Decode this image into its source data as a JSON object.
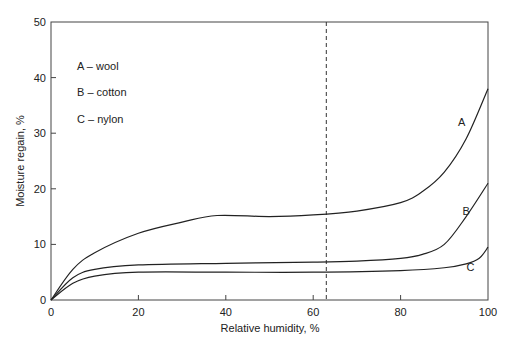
{
  "chart_data": {
    "type": "line",
    "title": "",
    "xlabel": "Relative humidity, %",
    "ylabel": "Moisture regain, %",
    "xlim": [
      0,
      100
    ],
    "ylim": [
      0,
      50
    ],
    "x_ticks": [
      "0",
      "20",
      "40",
      "60",
      "80",
      "100"
    ],
    "y_ticks": [
      "0",
      "10",
      "20",
      "30",
      "40",
      "50"
    ],
    "grid": false,
    "legend_position": "upper-left (inside)",
    "legend": [
      "A – wool",
      "B – cotton",
      "C – nylon"
    ],
    "annotations": [
      {
        "type": "vertical-dashed-line",
        "x": 63
      },
      {
        "type": "curve-label",
        "text": "A",
        "x": 94,
        "y": 32
      },
      {
        "type": "curve-label",
        "text": "B",
        "x": 95,
        "y": 16
      },
      {
        "type": "curve-label",
        "text": "C",
        "x": 96,
        "y": 6
      }
    ],
    "series": [
      {
        "name": "A – wool",
        "x": [
          0,
          5,
          10,
          20,
          30,
          38,
          50,
          60,
          70,
          80,
          85,
          90,
          95,
          100
        ],
        "values": [
          0,
          5.5,
          8.5,
          12,
          14,
          15.2,
          15,
          15.3,
          16,
          17.5,
          19.5,
          23,
          29,
          38
        ]
      },
      {
        "name": "B – cotton",
        "x": [
          0,
          5,
          10,
          20,
          40,
          60,
          70,
          80,
          85,
          90,
          95,
          100
        ],
        "values": [
          0,
          4,
          5.5,
          6.3,
          6.6,
          6.8,
          7,
          7.5,
          8.2,
          10,
          15,
          21
        ]
      },
      {
        "name": "C – nylon",
        "x": [
          0,
          5,
          10,
          20,
          40,
          60,
          80,
          90,
          95,
          98,
          100
        ],
        "values": [
          0,
          3,
          4.3,
          5,
          5,
          5,
          5.3,
          5.8,
          6.5,
          7.5,
          9.5
        ]
      }
    ]
  }
}
